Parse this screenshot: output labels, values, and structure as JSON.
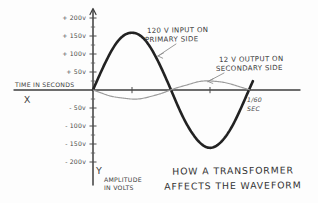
{
  "chart_data": {
    "type": "line",
    "title_lines": [
      "HOW A TRANSFORMER",
      "AFFECTS THE WAVEFORM"
    ],
    "xlabel": "TIME IN SECONDS",
    "ylabel": "AMPLITUDE IN VOLTS",
    "ylabel_lines": [
      "AMPLITUDE",
      "IN VOLTS"
    ],
    "x_axis_letter": "X",
    "y_axis_letter": "Y",
    "ylim": [
      -225,
      225
    ],
    "grid": false,
    "legend_position": "inline-annotations",
    "y_ticks": [
      {
        "v": 200,
        "label": "+ 200v"
      },
      {
        "v": 150,
        "label": "+ 150v"
      },
      {
        "v": 100,
        "label": "+ 100v"
      },
      {
        "v": 50,
        "label": "+ 50v"
      },
      {
        "v": -50,
        "label": "- 50v"
      },
      {
        "v": -100,
        "label": "- 100v"
      },
      {
        "v": -150,
        "label": "- 150v"
      },
      {
        "v": -200,
        "label": "- 200v"
      }
    ],
    "y_minor_ticks_v": [
      175,
      125,
      75,
      25,
      -25,
      -75,
      -125,
      -175
    ],
    "x_ticks_fraction_of_period": [
      0.25,
      0.75
    ],
    "period_seconds": "1/60",
    "period_label_lines": [
      "1/60",
      "SEC"
    ],
    "series": [
      {
        "id": "primary",
        "label": "120 V INPUT ON PRIMARY SIDE",
        "label_lines": [
          "120 V INPUT ON",
          "PRIMARY SIDE"
        ],
        "stated_voltage": "120 V",
        "drawn_peak_v": 160,
        "phase_deg": 0,
        "cycles_shown": 1,
        "color": "#222222",
        "stroke_width": 2.6
      },
      {
        "id": "secondary",
        "label": "12 V OUTPUT ON SECONDARY SIDE",
        "label_lines": [
          "12 V OUTPUT ON",
          "SECONDARY SIDE"
        ],
        "stated_voltage": "12 V",
        "drawn_peak_v": 25,
        "phase_deg": 180,
        "cycles_shown": 1,
        "color": "#9b9b9b",
        "stroke_width": 1.15
      }
    ],
    "colors": {
      "axis": "#3c3c3c",
      "text": "#3a3a3a",
      "annotation_arrow": "#8f8f8f",
      "background": "#fdfdfd"
    }
  }
}
